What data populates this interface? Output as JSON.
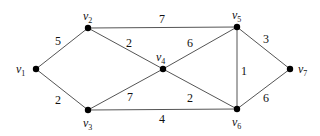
{
  "graph": {
    "nodes": [
      {
        "id": "v1",
        "base": "v",
        "sub": "1",
        "x": 36,
        "y": 69,
        "lx": 16,
        "ly": 73
      },
      {
        "id": "v2",
        "base": "v",
        "sub": "2",
        "x": 88,
        "y": 28,
        "lx": 83,
        "ly": 20
      },
      {
        "id": "v3",
        "base": "v",
        "sub": "3",
        "x": 88,
        "y": 110,
        "lx": 83,
        "ly": 127
      },
      {
        "id": "v4",
        "base": "v",
        "sub": "4",
        "x": 163,
        "y": 69,
        "lx": 156,
        "ly": 61
      },
      {
        "id": "v5",
        "base": "v",
        "sub": "5",
        "x": 237,
        "y": 27,
        "lx": 232,
        "ly": 19
      },
      {
        "id": "v6",
        "base": "v",
        "sub": "6",
        "x": 237,
        "y": 109,
        "lx": 232,
        "ly": 126
      },
      {
        "id": "v7",
        "base": "v",
        "sub": "7",
        "x": 290,
        "y": 69,
        "lx": 298,
        "ly": 73
      }
    ],
    "edges": [
      {
        "from": "v1",
        "to": "v2",
        "weight": "5",
        "lx": 55,
        "ly": 45
      },
      {
        "from": "v1",
        "to": "v3",
        "weight": "2",
        "lx": 55,
        "ly": 104
      },
      {
        "from": "v2",
        "to": "v5",
        "weight": "7",
        "lx": 159,
        "ly": 23
      },
      {
        "from": "v2",
        "to": "v4",
        "weight": "2",
        "lx": 126,
        "ly": 47
      },
      {
        "from": "v3",
        "to": "v4",
        "weight": "7",
        "lx": 127,
        "ly": 101
      },
      {
        "from": "v3",
        "to": "v6",
        "weight": "4",
        "lx": 159,
        "ly": 123
      },
      {
        "from": "v4",
        "to": "v5",
        "weight": "6",
        "lx": 187,
        "ly": 47
      },
      {
        "from": "v4",
        "to": "v6",
        "weight": "2",
        "lx": 187,
        "ly": 102
      },
      {
        "from": "v5",
        "to": "v6",
        "weight": "1",
        "lx": 241,
        "ly": 75
      },
      {
        "from": "v5",
        "to": "v7",
        "weight": "3",
        "lx": 263,
        "ly": 43
      },
      {
        "from": "v6",
        "to": "v7",
        "weight": "6",
        "lx": 263,
        "ly": 102
      }
    ]
  }
}
